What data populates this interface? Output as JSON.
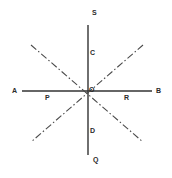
{
  "figure": {
    "type": "line-diagram",
    "canvas": {
      "width": 172,
      "height": 178,
      "background": "#ffffff"
    },
    "colors": {
      "solid_line": "#333333",
      "dashdot_line": "#4a4a4a",
      "label_text": "#2b2b2b"
    },
    "labels": {
      "A": "A",
      "B": "B",
      "S": "S",
      "Q": "Q",
      "P": "P",
      "R": "R",
      "O": "O",
      "C": "C",
      "D": "D"
    },
    "points": {
      "A": {
        "x": 22,
        "y": 91
      },
      "B": {
        "x": 152,
        "y": 91
      },
      "S": {
        "x": 88,
        "y": 25
      },
      "Q": {
        "x": 88,
        "y": 155
      },
      "P": {
        "x": 51,
        "y": 91
      },
      "R": {
        "x": 122,
        "y": 91
      },
      "O": {
        "x": 88,
        "y": 91
      },
      "C": {
        "x": 88,
        "y": 55
      },
      "D": {
        "x": 88,
        "y": 129
      }
    },
    "segments": [
      {
        "name": "line-AB",
        "style": "solid",
        "from": [
          22,
          91
        ],
        "to": [
          152,
          91
        ]
      },
      {
        "name": "line-SQ",
        "style": "solid",
        "from": [
          88,
          25
        ],
        "to": [
          88,
          155
        ]
      },
      {
        "name": "line-dashdot-1",
        "style": "dash-dot",
        "from": [
          31,
          45
        ],
        "to": [
          143,
          142
        ]
      },
      {
        "name": "line-dashdot-2",
        "style": "dash-dot",
        "from": [
          143,
          45
        ],
        "to": [
          31,
          142
        ]
      }
    ],
    "label_positions": {
      "A": {
        "left": 12,
        "top": 87
      },
      "B": {
        "left": 156,
        "top": 87
      },
      "S": {
        "left": 92,
        "top": 9
      },
      "Q": {
        "left": 93,
        "top": 156
      },
      "P": {
        "left": 45,
        "top": 94
      },
      "R": {
        "left": 124,
        "top": 94
      },
      "O": {
        "left": 89,
        "top": 86
      },
      "C": {
        "left": 90,
        "top": 49
      },
      "D": {
        "left": 90,
        "top": 127
      }
    }
  }
}
